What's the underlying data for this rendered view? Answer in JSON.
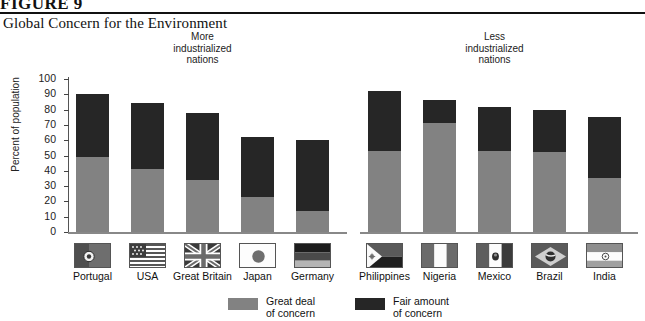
{
  "figure": {
    "number": "FIGURE 9",
    "title": "Global Concern for the Environment"
  },
  "colors": {
    "great_deal": "#828282",
    "fair_amount": "#262626",
    "axis": "#555555",
    "text": "#111111"
  },
  "groups": [
    {
      "id": "more",
      "label_line1": "More",
      "label_line2": "industrialized",
      "label_line3": "nations"
    },
    {
      "id": "less",
      "label_line1": "Less",
      "label_line2": "industrialized",
      "label_line3": "nations"
    }
  ],
  "legend": {
    "items": [
      {
        "key": "great_deal",
        "line1": "Great deal",
        "line2": "of concern",
        "color": "#828282"
      },
      {
        "key": "fair_amount",
        "line1": "Fair amount",
        "line2": "of concern",
        "color": "#262626"
      }
    ]
  },
  "chart_data": {
    "type": "bar",
    "subtype": "stacked-vertical",
    "title": "Global Concern for the Environment",
    "xlabel": "",
    "ylabel": "Percent of population",
    "ylim": [
      0,
      100
    ],
    "yticks": [
      0,
      10,
      20,
      30,
      40,
      50,
      60,
      70,
      80,
      90,
      100
    ],
    "grid": false,
    "legend_position": "bottom-center",
    "group_labels": [
      "More industrialized nations",
      "Less industrialized nations"
    ],
    "categories": [
      "Portugal",
      "USA",
      "Great Britain",
      "Japan",
      "Germany",
      "Philippines",
      "Nigeria",
      "Mexico",
      "Brazil",
      "India"
    ],
    "category_groups": [
      "More industrialized nations",
      "More industrialized nations",
      "More industrialized nations",
      "More industrialized nations",
      "More industrialized nations",
      "Less industrialized nations",
      "Less industrialized nations",
      "Less industrialized nations",
      "Less industrialized nations",
      "Less industrialized nations"
    ],
    "series": [
      {
        "name": "Great deal of concern",
        "color": "#828282",
        "values": [
          49,
          41,
          34,
          23,
          14,
          53,
          71,
          53,
          52,
          35
        ]
      },
      {
        "name": "Fair amount of concern",
        "color": "#262626",
        "values": [
          41,
          43,
          44,
          39,
          46,
          39,
          15,
          29,
          28,
          40
        ]
      }
    ],
    "totals": [
      90,
      84,
      78,
      62,
      60,
      92,
      86,
      82,
      80,
      75
    ],
    "flags": [
      {
        "country": "Portugal",
        "icon": "flag-portugal-icon"
      },
      {
        "country": "USA",
        "icon": "flag-usa-icon"
      },
      {
        "country": "Great Britain",
        "icon": "flag-great-britain-icon"
      },
      {
        "country": "Japan",
        "icon": "flag-japan-icon"
      },
      {
        "country": "Germany",
        "icon": "flag-germany-icon"
      },
      {
        "country": "Philippines",
        "icon": "flag-philippines-icon"
      },
      {
        "country": "Nigeria",
        "icon": "flag-nigeria-icon"
      },
      {
        "country": "Mexico",
        "icon": "flag-mexico-icon"
      },
      {
        "country": "Brazil",
        "icon": "flag-brazil-icon"
      },
      {
        "country": "India",
        "icon": "flag-india-icon"
      }
    ]
  }
}
